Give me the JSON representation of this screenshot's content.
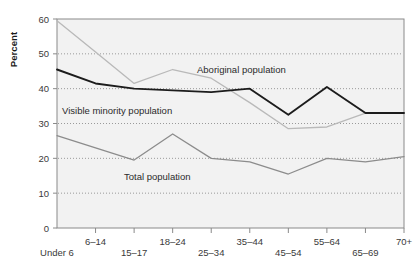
{
  "chart_data": {
    "type": "line",
    "title": "",
    "xlabel": "",
    "ylabel": "Percent",
    "ylim": [
      0,
      60
    ],
    "yticks": [
      0,
      10,
      20,
      30,
      40,
      50,
      60
    ],
    "grid": "horizontal-dotted",
    "legend": "inline-annotations",
    "categories": [
      "Under 6",
      "6–14",
      "15–17",
      "18–24",
      "25–34",
      "35–44",
      "45–54",
      "55–64",
      "65–69",
      "70+"
    ],
    "series": [
      {
        "name": "Aboriginal population",
        "color": "#b9b9b9",
        "values": [
          59.5,
          50.5,
          41.5,
          45.5,
          43.0,
          36.0,
          28.5,
          29.0,
          33.0,
          33.0
        ]
      },
      {
        "name": "Visible minority population",
        "color": "#1c1c1c",
        "values": [
          45.5,
          41.5,
          40.0,
          39.5,
          39.0,
          40.0,
          32.5,
          40.5,
          33.0,
          33.0
        ]
      },
      {
        "name": "Total population",
        "color": "#8c8c8c",
        "values": [
          26.5,
          23.0,
          19.5,
          27.0,
          20.0,
          19.0,
          15.5,
          20.0,
          19.0,
          20.5
        ]
      }
    ],
    "annotations": [
      {
        "text": "Aboriginal population",
        "x": 197,
        "y": 73
      },
      {
        "text": "Visible minority population",
        "x": 62,
        "y": 114
      },
      {
        "text": "Total population",
        "x": 124,
        "y": 180
      }
    ],
    "xtick_rows": [
      {
        "label": "Under 6",
        "index": 0,
        "row": 1
      },
      {
        "label": "6–14",
        "index": 1,
        "row": 0
      },
      {
        "label": "15–17",
        "index": 2,
        "row": 1
      },
      {
        "label": "18–24",
        "index": 3,
        "row": 0
      },
      {
        "label": "25–34",
        "index": 4,
        "row": 1
      },
      {
        "label": "35–44",
        "index": 5,
        "row": 0
      },
      {
        "label": "45–54",
        "index": 6,
        "row": 1
      },
      {
        "label": "55–64",
        "index": 7,
        "row": 0
      },
      {
        "label": "65–69",
        "index": 8,
        "row": 1
      },
      {
        "label": "70+",
        "index": 9,
        "row": 0
      }
    ],
    "plot_area": {
      "left": 57,
      "right": 404,
      "top": 19,
      "bottom": 228
    },
    "colors": {
      "plot_background": "#f2f2f2",
      "frame": "#8a8a8a",
      "gridline": "#9a9a9a",
      "text": "#3a3a3a"
    }
  }
}
